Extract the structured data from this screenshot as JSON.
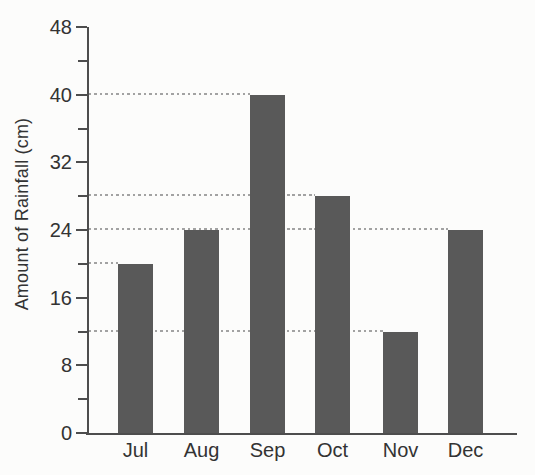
{
  "chart_data": {
    "type": "bar",
    "title": "",
    "categories": [
      "Jul",
      "Aug",
      "Sep",
      "Oct",
      "Nov",
      "Dec"
    ],
    "values": [
      20,
      24,
      40,
      28,
      12,
      24
    ],
    "xlabel": "",
    "ylabel": "Amount of Rainfall (cm)",
    "ylim": [
      0,
      48
    ],
    "yticks": [
      0,
      8,
      16,
      24,
      32,
      40,
      48
    ],
    "minor_ytick_step": 4,
    "legend_position": "none",
    "grid": "dashed horizontal leader lines from y-axis to each bar top",
    "bar_color": "#595959",
    "axis_color": "#4d4d4d",
    "dash_color": "#a2a2a2",
    "text_color": "#333333",
    "background_color": "#fcfcfb"
  }
}
